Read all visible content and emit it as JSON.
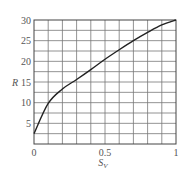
{
  "chart_data": {
    "type": "line",
    "title": "",
    "xlabel": "S_V",
    "xlabel_main": "S",
    "xlabel_sub": "V",
    "ylabel": "R",
    "xlim": [
      0,
      1
    ],
    "ylim": [
      0,
      30
    ],
    "grid": true,
    "x_ticks": [
      "0",
      "0.5",
      "1"
    ],
    "y_ticks": [
      "5",
      "10",
      "15",
      "20",
      "25",
      "30"
    ],
    "series": [
      {
        "name": "R vs S_V",
        "x": [
          0,
          0.1,
          0.2,
          0.3,
          0.4,
          0.5,
          0.6,
          0.7,
          0.8,
          0.9,
          1.0
        ],
        "values": [
          2.5,
          9.8,
          13.3,
          15.6,
          18.0,
          20.5,
          22.8,
          25.0,
          27.0,
          28.8,
          30.0
        ]
      }
    ],
    "line_color": "#222222",
    "grid_color": "#777777"
  }
}
